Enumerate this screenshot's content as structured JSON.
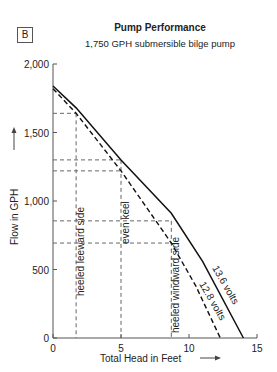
{
  "badge": "B",
  "chart_data": {
    "type": "line",
    "title": "Pump Performance",
    "subtitle": "1,750 GPH submersible bilge pump",
    "xlabel": "Total Head in Feet",
    "ylabel": "Flow in GPH",
    "xlim": [
      0,
      15
    ],
    "ylim": [
      0,
      2000
    ],
    "xticks": [
      0,
      5,
      10,
      15
    ],
    "xtick_labels": [
      "0",
      "5",
      "10",
      "15"
    ],
    "yticks": [
      0,
      500,
      1000,
      1500,
      2000
    ],
    "ytick_labels": [
      "0",
      "500",
      "1,000",
      "1,500",
      "2,000"
    ],
    "grid": false,
    "series": [
      {
        "name": "13.6 volts",
        "style": "solid",
        "x": [
          0,
          1.7,
          5,
          8.7,
          11,
          14
        ],
        "y": [
          1840,
          1680,
          1300,
          910,
          560,
          0
        ]
      },
      {
        "name": "12.8 volts",
        "style": "dashed",
        "x": [
          0,
          1.7,
          5,
          8.7,
          10.5,
          12.3
        ],
        "y": [
          1820,
          1640,
          1220,
          693,
          380,
          0
        ]
      }
    ],
    "reference_lines": [
      {
        "label": "heeled leeward side",
        "x": 1.7,
        "y_solid": 1640,
        "y_dashed": 1640
      },
      {
        "label": "even keel",
        "x": 5,
        "y_solid": 1300,
        "y_dashed": 1220
      },
      {
        "label": "heeled windward side",
        "x": 8.7,
        "y_solid": 855,
        "y_dashed": 693
      }
    ]
  }
}
